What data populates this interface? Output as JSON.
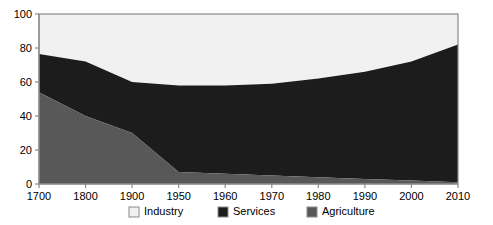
{
  "chart_data": {
    "type": "area",
    "stacked": true,
    "title": "",
    "subtitle": "",
    "xlabel": "",
    "ylabel": "",
    "categories": [
      "1700",
      "1800",
      "1900",
      "1950",
      "1960",
      "1970",
      "1980",
      "1990",
      "2000",
      "2010"
    ],
    "x_tick_labels": [
      "1700",
      "1800",
      "1900",
      "1950",
      "1960",
      "1970",
      "1980",
      "1990",
      "2000",
      "2010"
    ],
    "y_tick_labels": [
      "0",
      "20",
      "40",
      "60",
      "80",
      "100"
    ],
    "y_ticks": [
      0,
      20,
      40,
      60,
      80,
      100
    ],
    "ylim": [
      0,
      100
    ],
    "grid": false,
    "legend_position": "bottom",
    "stack_order_bottom_to_top": [
      "Agriculture",
      "Services",
      "Industry"
    ],
    "series": [
      {
        "name": "Agriculture",
        "color": "#585858",
        "values": [
          54,
          40,
          30,
          7,
          6,
          5,
          4,
          3,
          2,
          1
        ]
      },
      {
        "name": "Services",
        "color": "#1c1c1c",
        "values": [
          22.5,
          32,
          30,
          51,
          52,
          54,
          58,
          63,
          70,
          81
        ]
      },
      {
        "name": "Industry",
        "color": "#f1f1f1",
        "values": [
          23.5,
          28,
          40,
          42,
          42,
          41,
          38,
          34,
          28,
          18
        ]
      }
    ],
    "cumulative_top_boundaries": {
      "agriculture_top": [
        54,
        40,
        30,
        7,
        6,
        5,
        4,
        3,
        2,
        1
      ],
      "services_top": [
        76.5,
        72,
        60,
        58,
        58,
        59,
        62,
        66,
        72,
        82
      ],
      "industry_top": [
        100,
        100,
        100,
        100,
        100,
        100,
        100,
        100,
        100,
        100
      ]
    }
  },
  "legend": {
    "items": [
      {
        "label": "Industry",
        "color": "#f1f1f1"
      },
      {
        "label": "Services",
        "color": "#1c1c1c"
      },
      {
        "label": "Agriculture",
        "color": "#585858"
      }
    ]
  },
  "axis_colors": {
    "axis": "#8a8a8a",
    "text": "#000000"
  }
}
